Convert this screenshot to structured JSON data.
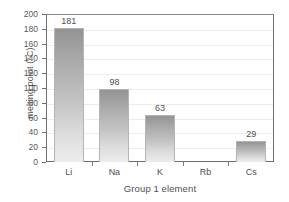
{
  "chart_data": {
    "type": "bar",
    "title": "",
    "categories": [
      "Li",
      "Na",
      "K",
      "Rb",
      "Cs"
    ],
    "values": [
      181,
      98,
      63,
      null,
      29
    ],
    "data_labels": [
      "181",
      "98",
      "63",
      "",
      "29"
    ],
    "series": [
      {
        "name": "melting point",
        "values": [
          181,
          98,
          63,
          null,
          29
        ]
      }
    ],
    "xlabel": "Group 1 element",
    "ylabel": "melting point (°C)",
    "ylim": [
      0,
      200
    ],
    "ytick_step": 20,
    "ytick_labels": [
      "200",
      "180",
      "160",
      "140",
      "120",
      "100",
      "80",
      "60",
      "40",
      "20",
      "0"
    ],
    "ytick_values": [
      200,
      180,
      160,
      140,
      120,
      100,
      80,
      60,
      40,
      20,
      0
    ],
    "grid": true,
    "legend": false,
    "bar_color_top": "#949494",
    "bar_color_bottom": "#ececec",
    "axis_color": "#6e6e6e",
    "gridline_color": "#ededed",
    "text_color": "#4f4f4f"
  }
}
